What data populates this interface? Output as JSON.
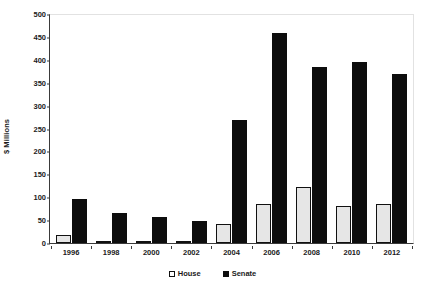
{
  "chart_data": {
    "type": "bar",
    "title": "",
    "xlabel": "",
    "ylabel": "$ Millions",
    "categories": [
      "1996",
      "1998",
      "2000",
      "2002",
      "2004",
      "2006",
      "2008",
      "2010",
      "2012"
    ],
    "series": [
      {
        "name": "House",
        "color": "#e6e6e6",
        "values": [
          17,
          3,
          2,
          2,
          41,
          85,
          122,
          80,
          85
        ]
      },
      {
        "name": "Senate",
        "color": "#0d0d0d",
        "values": [
          96,
          66,
          56,
          49,
          268,
          458,
          384,
          396,
          370
        ]
      }
    ],
    "ylim": [
      0,
      500
    ],
    "yticks": [
      0,
      50,
      100,
      150,
      200,
      250,
      300,
      350,
      400,
      450,
      500
    ],
    "ytick_labels": [
      "0",
      "50",
      "100",
      "150",
      "200",
      "250",
      "300",
      "350",
      "400",
      "450",
      "500"
    ],
    "grid": false,
    "legend_position": "bottom-center",
    "legend": [
      {
        "label": "House",
        "swatch": "open-square-icon"
      },
      {
        "label": "Senate",
        "swatch": "filled-square-icon"
      }
    ]
  }
}
